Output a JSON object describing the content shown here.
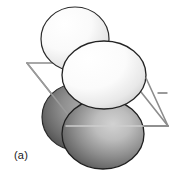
{
  "figure": {
    "panel_label": "(a)",
    "caption_alt": "Close-packed spheres intersected by a plane",
    "background_color": "#ffffff"
  },
  "plane": {
    "name": "intersecting-plane",
    "shape": "parallelogram",
    "stroke_color": "#8c8c8c",
    "stroke_width": 1.6,
    "fill": "none",
    "vertices": [
      {
        "x": 27,
        "y": 63
      },
      {
        "x": 118,
        "y": 63
      },
      {
        "x": 168,
        "y": 126
      },
      {
        "x": 77,
        "y": 126
      }
    ],
    "tick_mark": {
      "name": "plane-tick-mark",
      "x1": 158,
      "y1": 93,
      "x2": 167,
      "y2": 93,
      "color": "#7a7a7a"
    }
  },
  "spheres": [
    {
      "id": "back-light-sphere",
      "label": "upper-back light sphere",
      "cx": 75,
      "cy": 39,
      "rx": 34,
      "ry": 32,
      "tone": "light",
      "fill_center": "#ffffff",
      "fill_edge": "#d9d9d9",
      "stroke_color": "#2b2b2b",
      "stroke_width": 1.2,
      "highlight": {
        "cx": 62,
        "cy": 25,
        "r": 14
      }
    },
    {
      "id": "back-dark-sphere",
      "label": "lower-back dark sphere",
      "cx": 76,
      "cy": 117,
      "rx": 34,
      "ry": 33,
      "tone": "dark",
      "fill_center": "#9a9a9a",
      "fill_edge": "#4f4f4f",
      "stroke_color": "#2b2b2b",
      "stroke_width": 1.2,
      "highlight": {
        "cx": 92,
        "cy": 105,
        "r": 18
      }
    },
    {
      "id": "front-light-sphere",
      "label": "upper-front light sphere",
      "cx": 104,
      "cy": 75,
      "rx": 42,
      "ry": 34,
      "tone": "light",
      "fill_center": "#ffffff",
      "fill_edge": "#dcdcdc",
      "stroke_color": "#232323",
      "stroke_width": 1.3,
      "highlight": {
        "cx": 88,
        "cy": 60,
        "r": 18
      }
    },
    {
      "id": "front-dark-sphere",
      "label": "lower-front dark sphere",
      "cx": 103,
      "cy": 134,
      "rx": 41,
      "ry": 35,
      "tone": "dark",
      "fill_center": "#c2c2c2",
      "fill_edge": "#555555",
      "stroke_color": "#1f1f1f",
      "stroke_width": 1.3,
      "highlight": {
        "cx": 118,
        "cy": 122,
        "r": 20
      }
    }
  ],
  "colors": {
    "light_sphere_center": "#ffffff",
    "light_sphere_edge": "#d9d9d9",
    "dark_sphere_center": "#c2c2c2",
    "dark_sphere_edge": "#4f4f4f",
    "plane_line": "#8c8c8c",
    "outline": "#232323",
    "label_text": "#1a1a1a"
  }
}
